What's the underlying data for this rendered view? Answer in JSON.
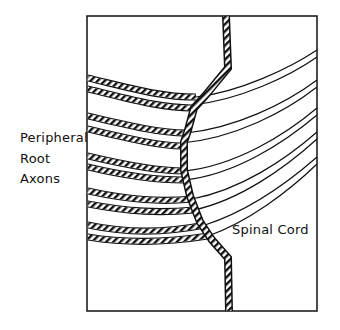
{
  "diagram": {
    "labels": {
      "axons_label": [
        "Peripheral",
        "Root",
        "Axons"
      ],
      "cord_label": "Spinal Cord"
    },
    "colors": {
      "ink": "#111111",
      "background": "#ffffff"
    },
    "axon_count": 5
  }
}
